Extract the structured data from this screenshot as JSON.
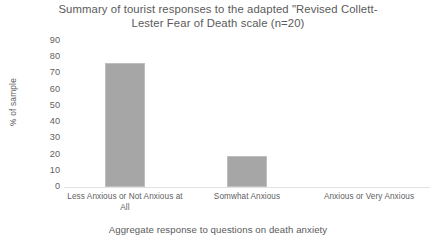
{
  "chart_data": {
    "type": "bar",
    "title": "Summary of tourist responses to the adapted \"Revised Collett-\nLester Fear of Death scale (n=20)",
    "title_line_1": "Summary of tourist responses to the adapted \"Revised Collett-",
    "title_line_2": "Lester Fear of Death scale (n=20)",
    "categories": [
      "Less Anxious or Not Anxious at All",
      "Somwhat Anxious",
      "Anxious or Very Anxious"
    ],
    "category_lines": [
      "Less Anxious or Not Anxious\nat All",
      "Somwhat Anxious",
      "Anxious or Very Anxious"
    ],
    "values": [
      80,
      20,
      0
    ],
    "xlabel": "Aggregate response to questions on death anxiety",
    "ylabel": "% of sample",
    "ylim": [
      0,
      90
    ],
    "ytick_step": 10,
    "yticks": [
      "90",
      "80",
      "70",
      "60",
      "50",
      "40",
      "30",
      "20",
      "10",
      "0"
    ],
    "grid": false,
    "legend": false,
    "bar_color": "#a6a6a6",
    "bar_border_color": "#bfbfbf",
    "axis_color": "#e2e2e2",
    "text_color": "#5a5a5a",
    "background": "#ffffff"
  }
}
